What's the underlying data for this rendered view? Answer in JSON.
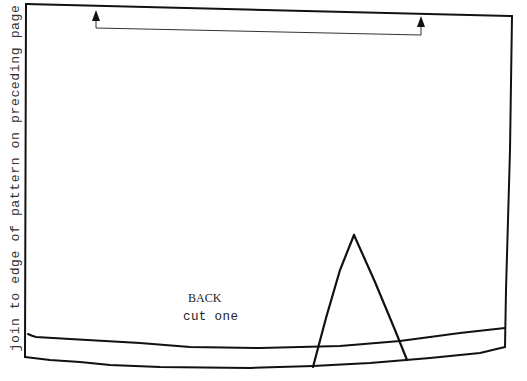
{
  "pattern": {
    "piece_name": "BACK",
    "cut_instruction": "cut one",
    "side_instruction": "join to edge of pattern on preceding page",
    "markings": {
      "grainline": "grainline-arrow",
      "dart": "dart-triangle",
      "hem": "hem-allowance-lines"
    },
    "colors": {
      "line": "#111111",
      "background": "#ffffff",
      "text": "#222222"
    }
  }
}
